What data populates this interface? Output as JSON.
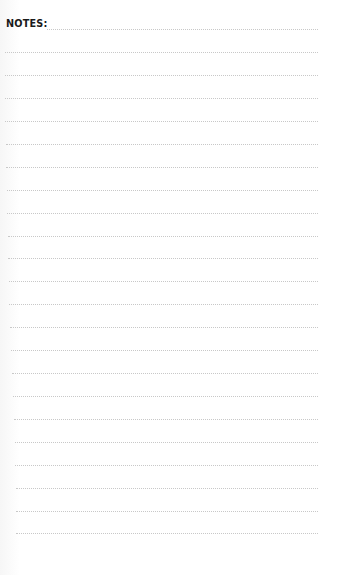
{
  "page": {
    "title": "NOTES:",
    "line_color": "#c8c8c8",
    "text_color": "#1a1a1a",
    "lines": [
      {
        "y": 29,
        "x1": 47,
        "x2": 318
      },
      {
        "y": 52,
        "x1": 5,
        "x2": 318
      },
      {
        "y": 75,
        "x1": 5,
        "x2": 318
      },
      {
        "y": 98,
        "x1": 5,
        "x2": 318
      },
      {
        "y": 121,
        "x1": 5,
        "x2": 318
      },
      {
        "y": 144,
        "x1": 6,
        "x2": 318
      },
      {
        "y": 167,
        "x1": 6,
        "x2": 318
      },
      {
        "y": 190,
        "x1": 7,
        "x2": 318
      },
      {
        "y": 213,
        "x1": 7,
        "x2": 318
      },
      {
        "y": 236,
        "x1": 8,
        "x2": 318
      },
      {
        "y": 258,
        "x1": 8,
        "x2": 318
      },
      {
        "y": 281,
        "x1": 9,
        "x2": 318
      },
      {
        "y": 304,
        "x1": 9,
        "x2": 318
      },
      {
        "y": 327,
        "x1": 10,
        "x2": 318
      },
      {
        "y": 350,
        "x1": 11,
        "x2": 318
      },
      {
        "y": 373,
        "x1": 12,
        "x2": 318
      },
      {
        "y": 396,
        "x1": 13,
        "x2": 318
      },
      {
        "y": 419,
        "x1": 14,
        "x2": 318
      },
      {
        "y": 442,
        "x1": 15,
        "x2": 318
      },
      {
        "y": 465,
        "x1": 15,
        "x2": 318
      },
      {
        "y": 488,
        "x1": 16,
        "x2": 318
      },
      {
        "y": 511,
        "x1": 16,
        "x2": 318
      },
      {
        "y": 533,
        "x1": 16,
        "x2": 318
      }
    ]
  }
}
